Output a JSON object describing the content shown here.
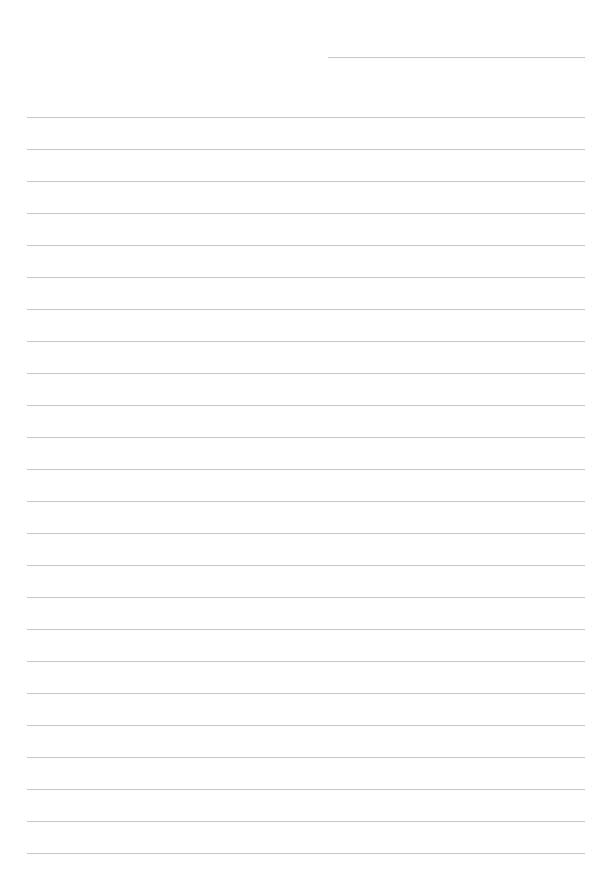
{
  "page": {
    "type": "lined-paper",
    "background": "#ffffff",
    "line_color": "#c6c6c6",
    "header_line": {
      "label": ""
    },
    "line_count": 24,
    "line_spacing_px": 32,
    "lines": [
      "",
      "",
      "",
      "",
      "",
      "",
      "",
      "",
      "",
      "",
      "",
      "",
      "",
      "",
      "",
      "",
      "",
      "",
      "",
      "",
      "",
      "",
      "",
      ""
    ]
  }
}
